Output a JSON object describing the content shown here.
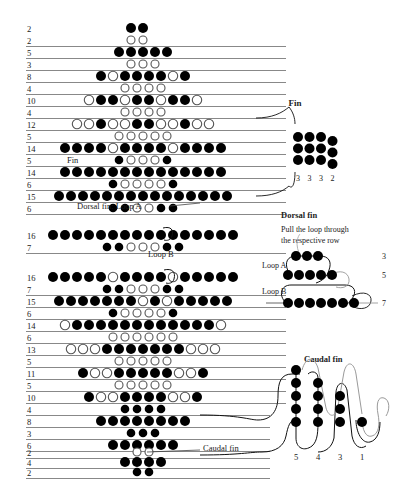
{
  "figure": {
    "type": "beading-pattern-chart",
    "title_text_visible": false,
    "dot_legend": {
      "filled": "black bead",
      "open": "white/outline bead"
    }
  },
  "colors": {
    "bead_filled": "#000000",
    "bead_open_stroke": "#555555",
    "bead_open_fill": "#ffffff",
    "guide_line": "#7a7a7a",
    "text": "#1a1a1a"
  },
  "main_chart": {
    "rows": [
      {
        "count": "2",
        "kind": "main",
        "y": 28,
        "line": false,
        "beads": "BB",
        "start": 131
      },
      {
        "count": "2",
        "kind": "offset",
        "y": 40,
        "line": true,
        "beads": "oo",
        "start": 131
      },
      {
        "count": "5",
        "kind": "main",
        "y": 52,
        "line": true,
        "beads": "BBBBB",
        "start": 119
      },
      {
        "count": "3",
        "kind": "offset",
        "y": 64,
        "line": true,
        "beads": "ooo",
        "start": 131
      },
      {
        "count": "8",
        "kind": "main",
        "y": 76,
        "line": true,
        "beads": "BoBBBBoB",
        "start": 101
      },
      {
        "count": "4",
        "kind": "offset",
        "y": 88,
        "line": true,
        "beads": "oooo",
        "start": 125
      },
      {
        "count": "10",
        "kind": "main",
        "y": 100,
        "line": true,
        "beads": "oBBoBBoBBo",
        "start": 89
      },
      {
        "count": "4",
        "kind": "offset",
        "y": 112,
        "line": true,
        "beads": "oooo",
        "start": 125
      },
      {
        "count": "12",
        "kind": "main",
        "y": 124,
        "line": true,
        "beads": "ooBooBBooBoo",
        "start": 77
      },
      {
        "count": "5",
        "kind": "offset",
        "y": 136,
        "line": true,
        "beads": "ooooo",
        "start": 119
      },
      {
        "count": "14",
        "kind": "main",
        "y": 148,
        "line": true,
        "beads": "BBBBoBBBBoBBBB",
        "start": 65
      },
      {
        "count": "5",
        "kind": "offset",
        "y": 160,
        "line": true,
        "beads": "BoooB",
        "start": 119
      },
      {
        "count": "14",
        "kind": "main",
        "y": 172,
        "line": true,
        "beads": "BBBBBBBBBBBBBB",
        "start": 65
      },
      {
        "count": "6",
        "kind": "offset",
        "y": 184,
        "line": true,
        "beads": "BooooB",
        "start": 113
      },
      {
        "count": "15",
        "kind": "main",
        "y": 196,
        "line": true,
        "beads": "BBBBBBBBBBBBBBB",
        "start": 59
      },
      {
        "count": "6",
        "kind": "offset",
        "y": 208,
        "line": true,
        "beads": "BBooBB",
        "start": 113
      },
      {
        "count": "16",
        "kind": "main",
        "y": 235,
        "line": false,
        "beads": "BBBBBBBBBBBBBBBB",
        "start": 53
      },
      {
        "count": "7",
        "kind": "offset",
        "y": 247,
        "line": true,
        "beads": "BBoooBB",
        "start": 107
      },
      {
        "count": "16",
        "kind": "main",
        "y": 277,
        "line": false,
        "beads": "BBBBBoBBBBoBBBBB",
        "start": 53
      },
      {
        "count": "7",
        "kind": "offset",
        "y": 289,
        "line": true,
        "beads": "BBoooBB",
        "start": 107
      },
      {
        "count": "15",
        "kind": "main",
        "y": 301,
        "line": true,
        "beads": "BBBBBBBoBoBBBBB",
        "start": 59
      },
      {
        "count": "6",
        "kind": "offset",
        "y": 313,
        "line": true,
        "beads": "BooooB",
        "start": 113
      },
      {
        "count": "14",
        "kind": "main",
        "y": 325,
        "line": true,
        "beads": "oBBBBBBBBBBBBo",
        "start": 65
      },
      {
        "count": "6",
        "kind": "offset",
        "y": 337,
        "line": true,
        "beads": "oooooo",
        "start": 113
      },
      {
        "count": "13",
        "kind": "main",
        "y": 349,
        "line": true,
        "beads": "oooBBBBBBBooo",
        "start": 71
      },
      {
        "count": "5",
        "kind": "offset",
        "y": 361,
        "line": true,
        "beads": "ooooo",
        "start": 119
      },
      {
        "count": "11",
        "kind": "main",
        "y": 373,
        "line": true,
        "beads": "BooBBBBBooB",
        "start": 83
      },
      {
        "count": "5",
        "kind": "offset",
        "y": 385,
        "line": true,
        "beads": "ooooo",
        "start": 119
      },
      {
        "count": "10",
        "kind": "main",
        "y": 397,
        "line": true,
        "beads": "BooBBBBooB",
        "start": 89
      },
      {
        "count": "4",
        "kind": "offset",
        "y": 409,
        "line": true,
        "beads": "BBBB",
        "start": 125
      },
      {
        "count": "8",
        "kind": "main",
        "y": 421,
        "line": true,
        "beads": "BBBBBBBB",
        "start": 101
      },
      {
        "count": "3",
        "kind": "offset",
        "y": 433,
        "line": true,
        "beads": "BBB",
        "start": 131
      },
      {
        "count": "6",
        "kind": "main",
        "y": 445,
        "line": true,
        "beads": "BBBBBB",
        "start": 113
      },
      {
        "count": "2",
        "kind": "offset",
        "y": 452,
        "line": true,
        "beads": "oo",
        "start": 137
      },
      {
        "count": "4",
        "kind": "main",
        "y": 462,
        "line": true,
        "beads": "BBBB",
        "start": 125
      },
      {
        "count": "2",
        "kind": "offset",
        "y": 472,
        "line": true,
        "beads": "BB",
        "start": 137
      }
    ],
    "annotations": [
      {
        "name": "fin-label",
        "text": "Fin",
        "x": 67,
        "y": 163
      },
      {
        "name": "dorsal-loop-a",
        "text": "Dorsal fin: Loop A",
        "x": 77,
        "y": 209
      },
      {
        "name": "loop-b-label",
        "text": "Loop B",
        "x": 148,
        "y": 257
      },
      {
        "name": "caudal-fin-inline",
        "text": "Caudal fin",
        "x": 203,
        "y": 451
      }
    ]
  },
  "fin_panel": {
    "title": "Fin",
    "grid_rows": 3,
    "grid_cols": 4,
    "column_labels": [
      "3",
      "3",
      "3",
      "2"
    ]
  },
  "dorsal_panel": {
    "title": "Dorsal fin",
    "instruction_line1": "Pull the loop through",
    "instruction_line2": "the respective row",
    "loop_a_label": "Loop A",
    "loop_b_label": "Loop B",
    "row_labels": [
      "3",
      "5",
      "7"
    ],
    "row_bead_counts": [
      3,
      5,
      7
    ]
  },
  "caudal_panel": {
    "title": "Caudal fin",
    "column_labels": [
      "5",
      "4",
      "3",
      "1"
    ],
    "column_bead_counts": [
      5,
      4,
      3,
      1
    ]
  }
}
